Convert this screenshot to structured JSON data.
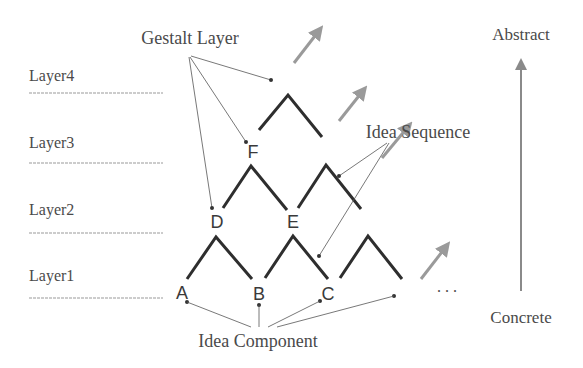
{
  "labels": {
    "gestalt_layer": "Gestalt Layer",
    "idea_sequence": "Idea Sequence",
    "idea_component": "Idea Component",
    "abstract": "Abstract",
    "concrete": "Concrete",
    "ellipsis": ". . ."
  },
  "layers": [
    "Layer4",
    "Layer3",
    "Layer2",
    "Layer1"
  ],
  "nodes": {
    "layer1": [
      "A",
      "B",
      "C"
    ],
    "layer2": [
      "D",
      "E"
    ],
    "layer3": [
      "F"
    ]
  },
  "colors": {
    "structure": "#2e2e2e",
    "arrow": "#9a9a9a",
    "text": "#4a4a4a"
  }
}
